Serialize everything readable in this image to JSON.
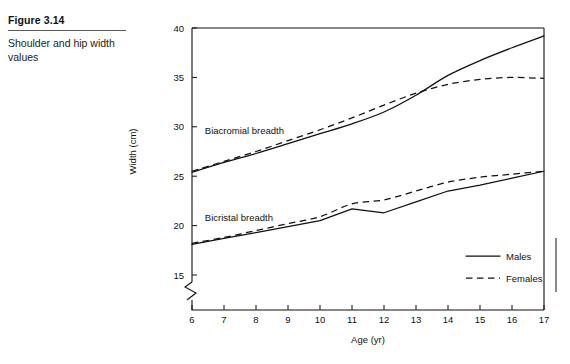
{
  "figure": {
    "number_label": "Figure 3.14",
    "caption": "Shoulder and hip width values"
  },
  "legend": {
    "males_label": "Males",
    "females_label": "Females",
    "position": "bottom-right"
  },
  "annotations": {
    "upper_group": "Biacromial breadth",
    "lower_group": "Bicristal breadth"
  },
  "chart_data": {
    "type": "line",
    "title": "Shoulder and hip width values",
    "xlabel": "Age (yr)",
    "ylabel": "Width (cm)",
    "xlim": [
      6,
      17
    ],
    "ylim": [
      13.2,
      40
    ],
    "y_axis_break": true,
    "y_break_note": "zigzag break between origin and 15 cm",
    "grid": false,
    "xticks": [
      6,
      7,
      8,
      9,
      10,
      11,
      12,
      13,
      14,
      15,
      16,
      17
    ],
    "yticks": [
      15,
      20,
      25,
      30,
      35,
      40
    ],
    "x": [
      6,
      7,
      8,
      9,
      10,
      11,
      12,
      13,
      14,
      15,
      16,
      17
    ],
    "series": [
      {
        "name": "Biacromial breadth - Males",
        "group": "Biacromial breadth",
        "sex": "Males",
        "style": "solid",
        "values": [
          25.4,
          26.4,
          27.3,
          28.3,
          29.3,
          30.3,
          31.5,
          33.2,
          35.2,
          36.7,
          38.0,
          39.2
        ]
      },
      {
        "name": "Biacromial breadth - Females",
        "group": "Biacromial breadth",
        "sex": "Females",
        "style": "dashed",
        "values": [
          25.5,
          26.5,
          27.5,
          28.6,
          29.7,
          30.9,
          32.2,
          33.4,
          34.3,
          34.8,
          35.0,
          34.9
        ]
      },
      {
        "name": "Bicristal breadth - Males",
        "group": "Bicristal breadth",
        "sex": "Males",
        "style": "solid",
        "values": [
          18.1,
          18.7,
          19.3,
          19.9,
          20.5,
          21.7,
          21.3,
          22.4,
          23.5,
          24.1,
          24.8,
          25.5
        ]
      },
      {
        "name": "Bicristal breadth - Females",
        "group": "Bicristal breadth",
        "sex": "Females",
        "style": "dashed",
        "values": [
          18.2,
          18.8,
          19.5,
          20.2,
          20.9,
          22.2,
          22.6,
          23.5,
          24.4,
          24.9,
          25.2,
          25.5
        ]
      }
    ]
  }
}
